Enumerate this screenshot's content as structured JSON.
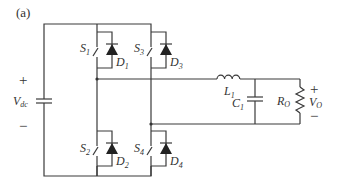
{
  "figure": {
    "panel_label": "(a)"
  },
  "source": {
    "name": "V",
    "sub": "dc",
    "plus": "+",
    "minus": "−"
  },
  "switches": [
    {
      "name": "S",
      "sub": "1",
      "diode": "D",
      "diode_sub": "1"
    },
    {
      "name": "S",
      "sub": "2",
      "diode": "D",
      "diode_sub": "2"
    },
    {
      "name": "S",
      "sub": "3",
      "diode": "D",
      "diode_sub": "3"
    },
    {
      "name": "S",
      "sub": "4",
      "diode": "D",
      "diode_sub": "4"
    }
  ],
  "filter": {
    "inductor": {
      "name": "L",
      "sub": "1"
    },
    "capacitor": {
      "name": "C",
      "sub": "1"
    }
  },
  "load": {
    "resistor": {
      "name": "R",
      "sub": "O"
    },
    "output": {
      "name": "V",
      "sub": "O",
      "plus": "+",
      "minus": "−"
    }
  }
}
